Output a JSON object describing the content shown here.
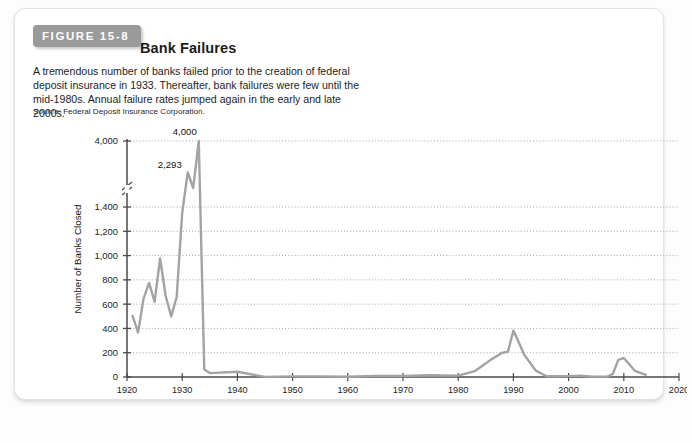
{
  "figure": {
    "tab_label": "FIGURE 15-8",
    "title": "Bank Failures",
    "description": "A tremendous number of banks failed prior to the creation of federal deposit insurance in 1933. Thereafter, bank failures were few until the mid-1980s. Annual failure rates jumped again in the early and late 2000s.",
    "source_label": "Source:",
    "source_text": "Federal Deposit Insurance Corporation."
  },
  "colors": {
    "tab_background": "#9a9a9a",
    "tab_text": "#ffffff",
    "line": "#a3a3a3",
    "axis": "#4a4a4a",
    "gridline": "#9b9b9b",
    "card_background": "#ffffff",
    "page_background": "#fdfdfd"
  },
  "chart_data": {
    "type": "line",
    "title": "Bank Failures",
    "xlabel": "Year",
    "ylabel": "Number of Banks Closed",
    "xlim": [
      1920,
      2020
    ],
    "ylim": [
      0,
      4000
    ],
    "grid": true,
    "legend": "none",
    "axis_break": {
      "between": [
        1400,
        4000
      ],
      "note": "y-axis is broken between 1,400 and 4,000"
    },
    "xticks": [
      1920,
      1930,
      1940,
      1950,
      1960,
      1970,
      1980,
      1990,
      2000,
      2010,
      2020
    ],
    "yticks": [
      0,
      200,
      400,
      600,
      800,
      1000,
      1200,
      1400,
      4000
    ],
    "ytick_labels": [
      "0",
      "200",
      "400",
      "600",
      "800",
      "1,000",
      "1,200",
      "1,400",
      "4,000"
    ],
    "annotations": [
      {
        "label": "4,000",
        "x": 1933,
        "y": 4000
      },
      {
        "label": "2,293",
        "x": 1931,
        "y": 2293
      }
    ],
    "series": [
      {
        "name": "Number of Banks Closed",
        "x": [
          1921,
          1922,
          1923,
          1924,
          1925,
          1926,
          1927,
          1928,
          1929,
          1930,
          1931,
          1932,
          1933,
          1934,
          1935,
          1940,
          1945,
          1950,
          1955,
          1960,
          1965,
          1970,
          1975,
          1980,
          1983,
          1984,
          1986,
          1988,
          1989,
          1990,
          1992,
          1994,
          1996,
          2000,
          2002,
          2004,
          2007,
          2008,
          2009,
          2010,
          2012,
          2014
        ],
        "y": [
          505,
          367,
          646,
          775,
          618,
          976,
          669,
          499,
          659,
          1352,
          2293,
          1453,
          4000,
          61,
          32,
          43,
          1,
          5,
          5,
          2,
          9,
          8,
          14,
          11,
          48,
          80,
          145,
          200,
          207,
          382,
          181,
          55,
          6,
          7,
          11,
          4,
          3,
          25,
          140,
          157,
          51,
          18
        ],
        "note": "Annual bank failures; values read from the plotted line. Broken axis compresses values above 1,400."
      }
    ]
  }
}
